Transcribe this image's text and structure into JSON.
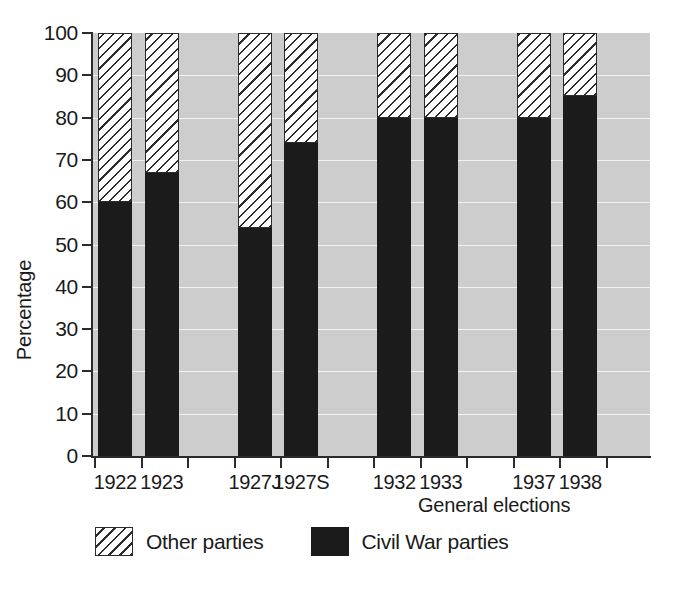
{
  "chart_data": {
    "type": "bar",
    "subtype": "stacked-bar-100-percent",
    "title": "",
    "xlabel": "General elections",
    "ylabel": "Percentage",
    "ylim": [
      0,
      100
    ],
    "ytick_step": 10,
    "ytick_labels": [
      "100",
      "90",
      "80",
      "70",
      "60",
      "50",
      "40",
      "30",
      "20",
      "10",
      "0"
    ],
    "ytick_values": [
      100,
      90,
      80,
      70,
      60,
      50,
      40,
      30,
      20,
      10,
      0
    ],
    "grid": true,
    "grid_color": "#f2f2f2",
    "plot_background": "#cdcdcd",
    "legend_position": "bottom",
    "categories": [
      "1922",
      "1923",
      "1927J",
      "1927S",
      "1932",
      "1933",
      "1937",
      "1938"
    ],
    "slot_count": 12,
    "category_slots": [
      0,
      1,
      3,
      4,
      6,
      7,
      9,
      10
    ],
    "series": [
      {
        "name": "Civil War parties",
        "color": "#1b1b1b",
        "pattern": "solid",
        "values": [
          60,
          67,
          54,
          74,
          80,
          80,
          80,
          85
        ]
      },
      {
        "name": "Other parties",
        "color": "#ffffff",
        "pattern": "diagonal-hatch",
        "values": [
          40,
          33,
          46,
          26,
          20,
          20,
          20,
          15
        ]
      }
    ]
  },
  "axes": {
    "y_title": "Percentage",
    "x_title": "General elections"
  },
  "legend": {
    "entries": [
      {
        "label": "Other parties",
        "swatch": "diagonal-hatch-swatch"
      },
      {
        "label": "Civil War parties",
        "swatch": "solid-black-swatch"
      }
    ]
  }
}
